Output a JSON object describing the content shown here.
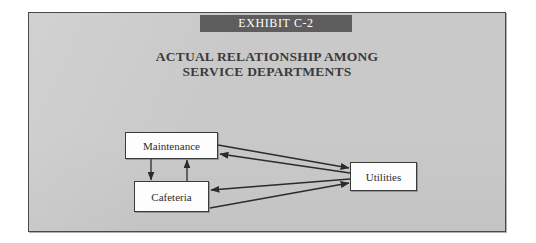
{
  "exhibit": {
    "banner_label": "EXHIBIT C-2",
    "title_line_1": "ACTUAL RELATIONSHIP AMONG",
    "title_line_2": "SERVICE DEPARTMENTS",
    "banner_color": "#5d5d5d",
    "background_color": "#c9c9c9",
    "border_color": "#4a4a4a",
    "title_color": "#3b3b3b"
  },
  "diagram": {
    "type": "relationship-diagram",
    "nodes": [
      {
        "id": "maintenance",
        "label": "Maintenance"
      },
      {
        "id": "cafeteria",
        "label": "Cafeteria"
      },
      {
        "id": "utilities",
        "label": "Utilities"
      }
    ],
    "edges": [
      {
        "from": "maintenance",
        "to": "cafeteria",
        "direction": "down"
      },
      {
        "from": "cafeteria",
        "to": "maintenance",
        "direction": "up"
      },
      {
        "from": "utilities",
        "to": "maintenance",
        "direction": "left"
      },
      {
        "from": "maintenance",
        "to": "utilities",
        "direction": "right"
      },
      {
        "from": "utilities",
        "to": "cafeteria",
        "direction": "left"
      },
      {
        "from": "cafeteria",
        "to": "utilities",
        "direction": "right"
      }
    ],
    "line_color": "#2b2b2b",
    "node_fill": "#fdfdfd",
    "node_border": "#3a3a3a"
  }
}
